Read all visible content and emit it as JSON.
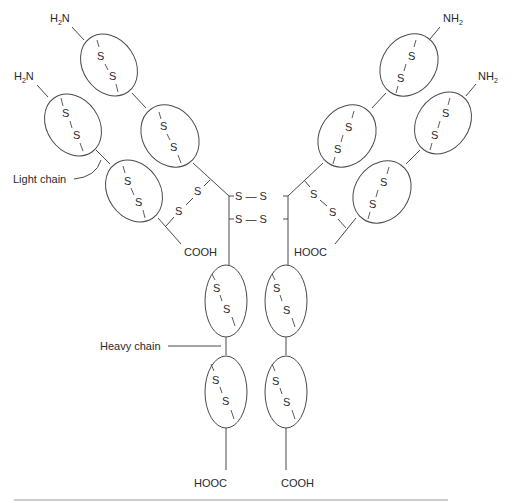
{
  "diagram": {
    "labels": {
      "light_chain": "Light chain",
      "heavy_chain": "Heavy chain"
    },
    "termini": {
      "heavy_left_n": {
        "main": "H",
        "sub": "2",
        "rest": "N"
      },
      "light_left_n": {
        "main": "H",
        "sub": "2",
        "rest": "N"
      },
      "heavy_right_n": {
        "main": "NH",
        "sub": "2"
      },
      "light_right_n": {
        "main": "NH",
        "sub": "2"
      },
      "light_left_c": "COOH",
      "light_right_c": "HOOC",
      "heavy_left_c": "HOOC",
      "heavy_right_c": "COOH"
    },
    "disulfide_symbol": "S",
    "domains": [
      {
        "id": "VH-left",
        "chain": "heavy"
      },
      {
        "id": "CH1-left",
        "chain": "heavy"
      },
      {
        "id": "VL-left",
        "chain": "light"
      },
      {
        "id": "CL-left",
        "chain": "light"
      },
      {
        "id": "VH-right",
        "chain": "heavy"
      },
      {
        "id": "CH1-right",
        "chain": "heavy"
      },
      {
        "id": "VL-right",
        "chain": "light"
      },
      {
        "id": "CL-right",
        "chain": "light"
      },
      {
        "id": "CH2-left",
        "chain": "heavy"
      },
      {
        "id": "CH3-left",
        "chain": "heavy"
      },
      {
        "id": "CH2-right",
        "chain": "heavy"
      },
      {
        "id": "CH3-right",
        "chain": "heavy"
      }
    ],
    "interchain_bonds": {
      "hinge": [
        "S — S",
        "S — S"
      ],
      "heavy_light_left": [
        "S",
        "S"
      ],
      "heavy_light_right": [
        "S",
        "S"
      ]
    },
    "colors": {
      "stroke": "#4a4a4a",
      "text": "#2a2a2a",
      "rule": "#9a9a9a",
      "background": "#ffffff"
    }
  }
}
